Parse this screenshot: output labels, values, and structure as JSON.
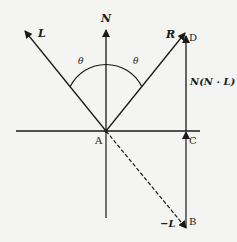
{
  "diagram": {
    "vectors": {
      "L": "L",
      "N": "N",
      "R": "R",
      "negL": "−L",
      "projection": "N(N · L)"
    },
    "points": {
      "A": "A",
      "B": "B",
      "C": "C",
      "D": "D"
    },
    "angles": {
      "left": "θ",
      "right": "θ"
    },
    "colors": {
      "stroke": "#1a1a1a",
      "background": "#f4f4f2"
    }
  }
}
